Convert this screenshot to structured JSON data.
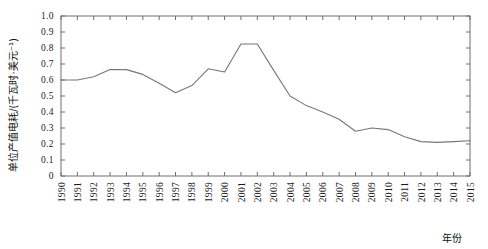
{
  "chart_data": {
    "type": "line",
    "title": "",
    "xlabel": "年份",
    "ylabel": "单位产值电耗/(千瓦时·美元⁻¹)",
    "xlim": [
      1990,
      2015
    ],
    "ylim": [
      0,
      1.0
    ],
    "grid": false,
    "legend": "none",
    "y_ticks": [
      "0",
      "0.1",
      "0.2",
      "0.3",
      "0.4",
      "0.5",
      "0.6",
      "0.7",
      "0.8",
      "0.9",
      "1.0"
    ],
    "x_ticks": [
      "1990",
      "1991",
      "1992",
      "1993",
      "1994",
      "1995",
      "1996",
      "1997",
      "1998",
      "1999",
      "2000",
      "2001",
      "2002",
      "2003",
      "2004",
      "2005",
      "2006",
      "2007",
      "2008",
      "2009",
      "2010",
      "2011",
      "2012",
      "2013",
      "2014",
      "2015"
    ],
    "categories": [
      1990,
      1991,
      1992,
      1993,
      1994,
      1995,
      1996,
      1997,
      1998,
      1999,
      2000,
      2001,
      2002,
      2003,
      2004,
      2005,
      2006,
      2007,
      2008,
      2009,
      2010,
      2011,
      2012,
      2013,
      2014,
      2015
    ],
    "values": [
      0.6,
      0.6,
      0.62,
      0.665,
      0.665,
      0.635,
      0.58,
      0.52,
      0.565,
      0.67,
      0.65,
      0.825,
      0.825,
      0.66,
      0.5,
      0.44,
      0.4,
      0.355,
      0.28,
      0.3,
      0.29,
      0.245,
      0.215,
      0.21,
      0.215,
      0.22
    ],
    "series": [
      {
        "name": "单位产值电耗",
        "color": "#777777",
        "values": [
          0.6,
          0.6,
          0.62,
          0.665,
          0.665,
          0.635,
          0.58,
          0.52,
          0.565,
          0.67,
          0.65,
          0.825,
          0.825,
          0.66,
          0.5,
          0.44,
          0.4,
          0.355,
          0.28,
          0.3,
          0.29,
          0.245,
          0.215,
          0.21,
          0.215,
          0.22
        ]
      }
    ]
  },
  "axes": {
    "y_title": "单位产值电耗/(千瓦时·美元⁻¹)",
    "x_title": "年份"
  },
  "caption": {
    "text": ""
  },
  "colors": {
    "line": "#777777",
    "axis": "#6e6e6e",
    "background": "#ffffff",
    "text": "#1a1a1a"
  }
}
